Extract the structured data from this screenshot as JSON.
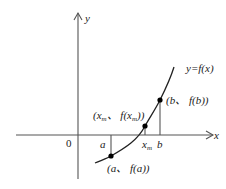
{
  "diagram": {
    "function_label": "y=f(x)",
    "axes": {
      "x_label": "x",
      "y_label": "y",
      "origin_label": "0"
    },
    "ticks": {
      "a": "a",
      "xm_base": "x",
      "xm_sub": "m",
      "b": "b"
    },
    "points": {
      "a": {
        "open": "(a、 f(a))"
      },
      "xm": {
        "part1": "(x",
        "sub1": "m",
        "part2": "、 f(x",
        "sub2": "m",
        "part3": "))"
      },
      "b": {
        "text": "(b、 f(b))"
      }
    },
    "colors": {
      "axis": "#555555",
      "curve": "#222222",
      "point": "#000000"
    }
  }
}
